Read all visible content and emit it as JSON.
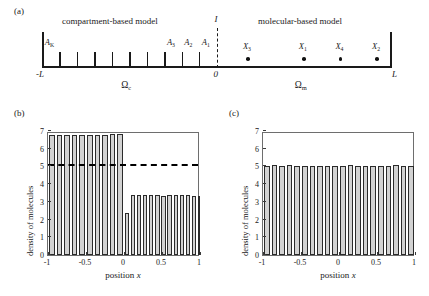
{
  "panels": {
    "a": {
      "label": "(a)",
      "title_left": "compartment-based model",
      "title_right": "molecular-based model",
      "interface_label": "I",
      "left_end_label": "-L",
      "center_label": "0",
      "right_end_label": "L",
      "domain_left_label": "Ω",
      "domain_left_sub": "c",
      "domain_right_label": "Ω",
      "domain_right_sub": "m",
      "compartment_count": 10,
      "compartment_labels": [
        {
          "base": "A",
          "sub": "K",
          "index": 0
        },
        {
          "base": "A",
          "sub": "3",
          "index": 7
        },
        {
          "base": "A",
          "sub": "2",
          "index": 8
        },
        {
          "base": "A",
          "sub": "1",
          "index": 9
        }
      ],
      "molecules": [
        {
          "base": "X",
          "sub": "3",
          "pos": 0.18
        },
        {
          "base": "X",
          "sub": "1",
          "pos": 0.5
        },
        {
          "base": "X",
          "sub": "4",
          "pos": 0.71
        },
        {
          "base": "X",
          "sub": "2",
          "pos": 0.92
        }
      ]
    },
    "b": {
      "label": "(b)"
    },
    "c": {
      "label": "(c)"
    }
  },
  "chart_data": [
    {
      "type": "bar",
      "panel": "(b)",
      "title": "",
      "xlabel": "position x",
      "ylabel": "density of molecules",
      "xlim": [
        -1,
        1
      ],
      "ylim": [
        0,
        7
      ],
      "xticks": [
        -1,
        -0.5,
        0,
        0.5,
        1
      ],
      "xticklabels": [
        "-1",
        "-0.5",
        "0",
        "0.5",
        "1"
      ],
      "yticks": [
        0,
        1,
        2,
        3,
        4,
        5,
        6,
        7
      ],
      "yticklabels": [
        "0",
        "1",
        "2",
        "3",
        "4",
        "5",
        "6",
        "7"
      ],
      "grid": false,
      "legend": null,
      "bar_edges": [
        -1.0,
        -0.9,
        -0.8,
        -0.7,
        -0.6,
        -0.5,
        -0.4,
        -0.3,
        -0.2,
        -0.1,
        0.0,
        0.08,
        0.16,
        0.24,
        0.32,
        0.4,
        0.48,
        0.56,
        0.64,
        0.72,
        0.8,
        0.88,
        0.96,
        1.0
      ],
      "values": [
        6.8,
        6.8,
        6.75,
        6.78,
        6.76,
        6.78,
        6.77,
        6.8,
        6.82,
        6.83,
        2.35,
        3.38,
        3.38,
        3.36,
        3.36,
        3.37,
        3.35,
        3.36,
        3.38,
        3.37,
        3.36,
        3.35,
        3.33
      ],
      "annotations": [
        {
          "type": "hline",
          "y": 5,
          "style": "dashed",
          "color": "#000000"
        }
      ]
    },
    {
      "type": "bar",
      "panel": "(c)",
      "title": "",
      "xlabel": "position x",
      "ylabel": "density of molecules",
      "xlim": [
        -1,
        1
      ],
      "ylim": [
        0,
        7
      ],
      "xticks": [
        -1,
        -0.5,
        0,
        0.5,
        1
      ],
      "xticklabels": [
        "-1",
        "-0.5",
        "0",
        "0.5",
        "1"
      ],
      "yticks": [
        0,
        1,
        2,
        3,
        4,
        5,
        6,
        7
      ],
      "yticklabels": [
        "0",
        "1",
        "2",
        "3",
        "4",
        "5",
        "6",
        "7"
      ],
      "grid": false,
      "legend": null,
      "bar_edges": [
        -1.0,
        -0.9,
        -0.8,
        -0.7,
        -0.6,
        -0.5,
        -0.4,
        -0.3,
        -0.2,
        -0.1,
        0.0,
        0.1,
        0.2,
        0.3,
        0.4,
        0.5,
        0.6,
        0.7,
        0.8,
        0.9,
        1.0
      ],
      "values": [
        5.02,
        5.06,
        5.04,
        5.08,
        5.03,
        5.05,
        5.0,
        5.02,
        5.01,
        5.04,
        5.03,
        5.06,
        5.02,
        5.05,
        5.0,
        5.04,
        5.02,
        5.06,
        5.03,
        5.05
      ],
      "annotations": []
    }
  ]
}
